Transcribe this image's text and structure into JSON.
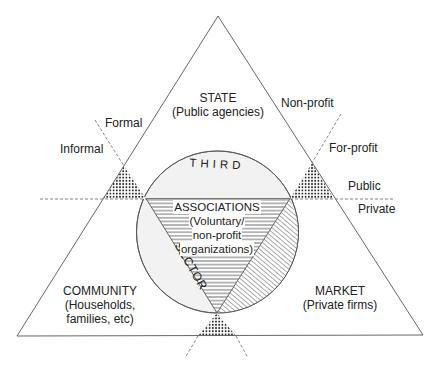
{
  "diagram": {
    "apexes": {
      "state": {
        "name": "STATE",
        "sub": "(Public agencies)"
      },
      "community": {
        "name": "COMMUNITY",
        "sub1": "(Households,",
        "sub2": "families, etc)"
      },
      "market": {
        "name": "MARKET",
        "sub": "(Private firms)"
      }
    },
    "axes": {
      "formal": "Formal",
      "informal": "Informal",
      "non_profit": "Non-profit",
      "for_profit": "For-profit",
      "public": "Public",
      "private": "Private"
    },
    "circle": {
      "top_label": "THIRD",
      "side_label": "SECTOR",
      "center_lines": [
        "ASSOCIATIONS",
        "(Voluntary/",
        "non-profit",
        "organizations)"
      ]
    },
    "colors": {
      "line": "#555555",
      "text": "#222222",
      "circle_fill": "#f2f2f2",
      "hatch": "#444444"
    }
  }
}
